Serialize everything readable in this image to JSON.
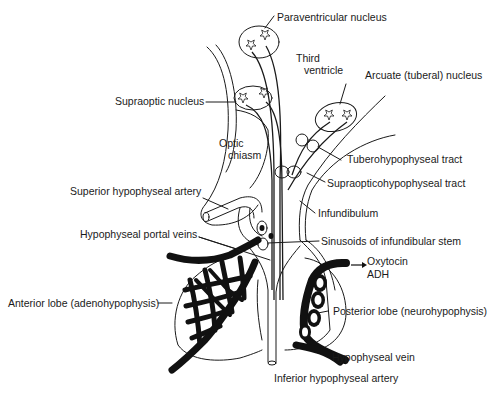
{
  "diagram": {
    "labels": {
      "paraventricular": "Paraventricular nucleus",
      "third_ventricle_1": "Third",
      "third_ventricle_2": "ventricle",
      "arcuate": "Arcuate (tuberal) nucleus",
      "supraoptic": "Supraoptic nucleus",
      "optic_chiasm_1": "Optic",
      "optic_chiasm_2": "chiasm",
      "tuberohypophyseal": "Tuberohypophyseal tract",
      "supraopticohypophyseal": "Supraopticohypophyseal tract",
      "superior_artery": "Superior hypophyseal artery",
      "infundibulum": "Infundibulum",
      "portal_veins": "Hypophyseal portal veins",
      "sinusoids": "Sinusoids of infundibular stem",
      "oxytocin": "Oxytocin",
      "adh": "ADH",
      "anterior_lobe": "Anterior lobe (adenohypophysis)",
      "posterior_lobe": "Posterior lobe (neurohypophysis)",
      "hypophyseal_vein": "Hypophyseal vein",
      "inferior_artery": "Inferior hypophyseal artery"
    },
    "colors": {
      "ink": "#1a1a1a",
      "background": "#ffffff"
    }
  }
}
